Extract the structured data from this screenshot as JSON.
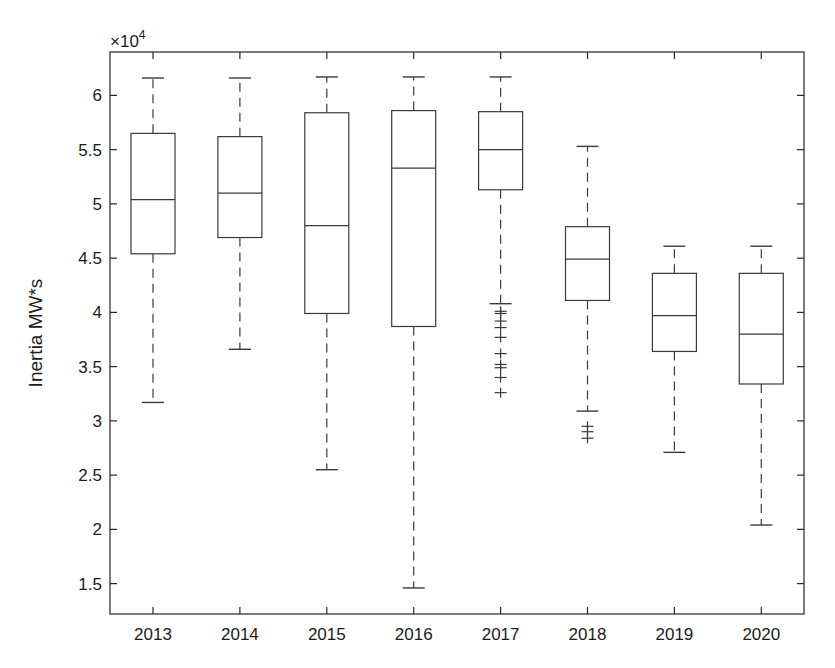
{
  "chart_data": {
    "type": "box",
    "title": "",
    "xlabel": "",
    "ylabel": "Inertia MW*s",
    "y_exponent_label": "×10",
    "y_exponent_power": "4",
    "ylim": [
      1.22,
      6.4
    ],
    "yticks": [
      1.5,
      2,
      2.5,
      3,
      3.5,
      4,
      4.5,
      5,
      5.5,
      6
    ],
    "ytick_labels": [
      "1.5",
      "2",
      "2.5",
      "3",
      "3.5",
      "4",
      "4.5",
      "5",
      "5.5",
      "6"
    ],
    "grid": false,
    "legend": null,
    "units_note": "values in ×10^4 MW*s",
    "categories": [
      "2013",
      "2014",
      "2015",
      "2016",
      "2017",
      "2018",
      "2019",
      "2020"
    ],
    "boxes": [
      {
        "label": "2013",
        "whisker_low": 3.17,
        "q1": 4.54,
        "median": 5.04,
        "q3": 5.65,
        "whisker_high": 6.16,
        "outliers": []
      },
      {
        "label": "2014",
        "whisker_low": 3.66,
        "q1": 4.69,
        "median": 5.1,
        "q3": 5.62,
        "whisker_high": 6.16,
        "outliers": []
      },
      {
        "label": "2015",
        "whisker_low": 2.55,
        "q1": 3.99,
        "median": 4.8,
        "q3": 5.84,
        "whisker_high": 6.17,
        "outliers": []
      },
      {
        "label": "2016",
        "whisker_low": 1.46,
        "q1": 3.87,
        "median": 5.33,
        "q3": 5.86,
        "whisker_high": 6.17,
        "outliers": []
      },
      {
        "label": "2017",
        "whisker_low": 4.08,
        "q1": 5.13,
        "median": 5.5,
        "q3": 5.85,
        "whisker_high": 6.17,
        "outliers": [
          4.01,
          3.99,
          3.92,
          3.86,
          3.77,
          3.62,
          3.52,
          3.49,
          3.4,
          3.26
        ]
      },
      {
        "label": "2018",
        "whisker_low": 3.09,
        "q1": 4.11,
        "median": 4.49,
        "q3": 4.79,
        "whisker_high": 5.53,
        "outliers": [
          2.95,
          2.9,
          2.84
        ]
      },
      {
        "label": "2019",
        "whisker_low": 2.71,
        "q1": 3.64,
        "median": 3.97,
        "q3": 4.36,
        "whisker_high": 4.61,
        "outliers": []
      },
      {
        "label": "2020",
        "whisker_low": 2.04,
        "q1": 3.34,
        "median": 3.8,
        "q3": 4.36,
        "whisker_high": 4.61,
        "outliers": []
      }
    ]
  },
  "layout": {
    "plot_left": 110,
    "plot_right": 804,
    "plot_top": 52,
    "plot_bottom": 614,
    "first_category_x": 153,
    "category_spacing": 86.9,
    "box_half_width": 22,
    "cap_half_width": 11
  }
}
